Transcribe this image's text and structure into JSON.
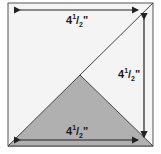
{
  "diagram": {
    "shape": "square",
    "square_fill": "#f4f4f4",
    "triangle_fill": "#b0b0b0",
    "stroke_color": "#444444",
    "dimensions": {
      "top": {
        "whole": "4",
        "num": "1",
        "den": "2",
        "unit": "\""
      },
      "right": {
        "whole": "4",
        "num": "1",
        "den": "2",
        "unit": "\""
      },
      "bottom": {
        "whole": "4",
        "num": "1",
        "den": "2",
        "unit": "\""
      }
    }
  }
}
